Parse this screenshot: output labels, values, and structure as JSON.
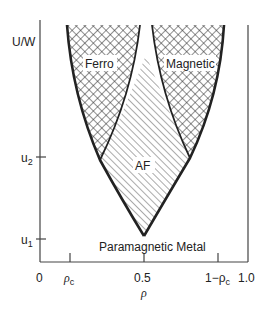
{
  "diagram": {
    "type": "phase-diagram",
    "y_axis": {
      "label": "U/W",
      "ticks": [
        {
          "label": "u",
          "sub": "2",
          "y": 157
        },
        {
          "label": "u",
          "sub": "1",
          "y": 239
        }
      ]
    },
    "x_axis": {
      "label": "ρ",
      "ticks": [
        {
          "label": "0",
          "x": 40
        },
        {
          "label": "ρ",
          "sub": "c",
          "x": 70
        },
        {
          "label": "0.5",
          "x": 144
        },
        {
          "label": "1−ρ",
          "sub": "c",
          "x": 218
        },
        {
          "label": "1.0",
          "x": 248
        }
      ]
    },
    "regions": [
      {
        "name": "Ferro",
        "pattern": "crosshatch"
      },
      {
        "name": "Magnetic",
        "pattern": "crosshatch"
      },
      {
        "name": "AF",
        "pattern": "diagonal-hatch"
      },
      {
        "name": "Paramagnetic Metal",
        "pattern": "none"
      }
    ],
    "colors": {
      "line": "#222222",
      "background": "#ffffff"
    }
  },
  "labels": {
    "y_axis": "U/W",
    "u2_main": "u",
    "u2_sub": "2",
    "u1_main": "u",
    "u1_sub": "1",
    "x0": "0",
    "rho_c_main": "ρ",
    "rho_c_sub": "c",
    "x_half": "0.5",
    "one_minus_main": "1−ρ",
    "one_minus_sub": "c",
    "x_one": "1.0",
    "x_axis": "ρ",
    "ferro": "Ferro",
    "magnetic": "Magnetic",
    "af": "AF",
    "para": "Paramagnetic Metal"
  }
}
